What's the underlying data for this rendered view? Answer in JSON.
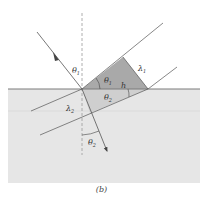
{
  "figure": {
    "caption": "(b)",
    "labels": {
      "theta1_incident": "θ",
      "theta1_incident_sub": "1",
      "theta1_triangle": "θ",
      "theta1_triangle_sub": "1",
      "lambda1": "λ",
      "lambda1_sub": "1",
      "h": "h",
      "theta2_triangle": "θ",
      "theta2_triangle_sub": "2",
      "lambda2": "λ",
      "lambda2_sub": "2",
      "theta2_refracted": "θ",
      "theta2_refracted_sub": "2"
    },
    "colors": {
      "medium2_fill": "#e6e6e6",
      "upper_triangle_fill": "#a9a9a9",
      "lower_triangle_fill": "#cfcfcf",
      "interface_line": "#7a7a7a",
      "lines": "#555555",
      "normal_dashed": "#9a9a9a"
    }
  }
}
